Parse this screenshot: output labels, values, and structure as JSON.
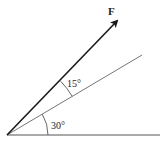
{
  "diagram": {
    "force_label": "F",
    "angle_between_label": "15°",
    "angle_base_label": "30°",
    "colors": {
      "line": "#555555",
      "arrow": "#1a1a1a",
      "text": "#222222",
      "background": "#ffffff"
    }
  }
}
